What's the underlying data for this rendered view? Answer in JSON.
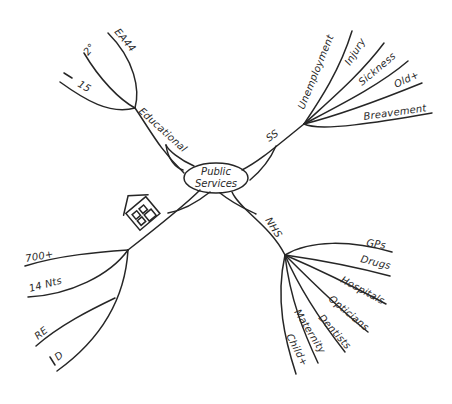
{
  "diagram": {
    "type": "mind-map",
    "style": "hand-drawn",
    "center": {
      "line1": "Public",
      "line2": "Services"
    },
    "branches": {
      "educational": {
        "label": "Educational",
        "children": [
          "EA44",
          "2°",
          "→15"
        ]
      },
      "ss": {
        "label": "SS",
        "children": [
          "Unemployment",
          "Injury",
          "Sickness",
          "Old+",
          "Breavement"
        ]
      },
      "housing": {
        "label": "house-icon",
        "children": [
          "700+",
          "14 Nts",
          "RE",
          "\\D"
        ]
      },
      "nhs": {
        "label": "NHS",
        "children": [
          "GPs",
          "Drugs",
          "Hospitals",
          "Opticians",
          "Dentists",
          "Maternity",
          "Child+"
        ]
      }
    },
    "colors": {
      "ink": "#262626",
      "background": "#ffffff"
    }
  }
}
